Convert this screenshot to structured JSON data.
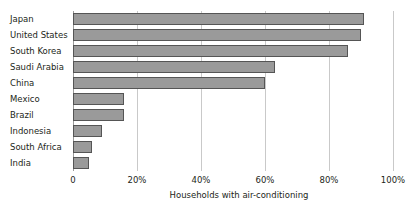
{
  "chart_data": {
    "type": "bar",
    "orientation": "horizontal",
    "title": "",
    "xlabel": "Households with air-conditioning",
    "ylabel": "",
    "xlim": [
      0,
      100
    ],
    "xticks": [
      0,
      20,
      40,
      60,
      80,
      100
    ],
    "xticklabels": [
      "0",
      "20%",
      "40%",
      "60%",
      "80%",
      "100%"
    ],
    "grid": true,
    "legend": null,
    "categories": [
      "Japan",
      "United States",
      "South Korea",
      "Saudi Arabia",
      "China",
      "Mexico",
      "Brazil",
      "Indonesia",
      "South Africa",
      "India"
    ],
    "values": [
      91,
      90,
      86,
      63,
      60,
      16,
      16,
      9,
      6,
      5
    ],
    "series": [
      {
        "name": "Households with air-conditioning",
        "values": [
          91,
          90,
          86,
          63,
          60,
          16,
          16,
          9,
          6,
          5
        ]
      }
    ],
    "colors": {
      "bar_fill": "#9a9a9a",
      "bar_border": "#555555",
      "gridline": "#c9c9c9",
      "axis_line": "#9a9a9a",
      "text": "#231f20",
      "background": "#ffffff"
    }
  }
}
